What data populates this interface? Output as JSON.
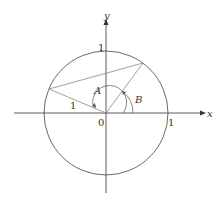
{
  "diagram": {
    "type": "unit-circle",
    "axes": {
      "x_label": "x",
      "y_label": "y"
    },
    "labels": {
      "origin": "0",
      "x_tick": "1",
      "y_tick": "1",
      "radius": "1",
      "angle_a": "A",
      "angle_b": "B"
    },
    "colors": {
      "axes": "#333333",
      "circle": "#444444",
      "chords": "#888888"
    },
    "geometry": {
      "center": [
        106,
        113
      ],
      "radius": 62,
      "point_upper_right": [
        143,
        63
      ],
      "point_left": [
        49,
        89
      ]
    }
  }
}
